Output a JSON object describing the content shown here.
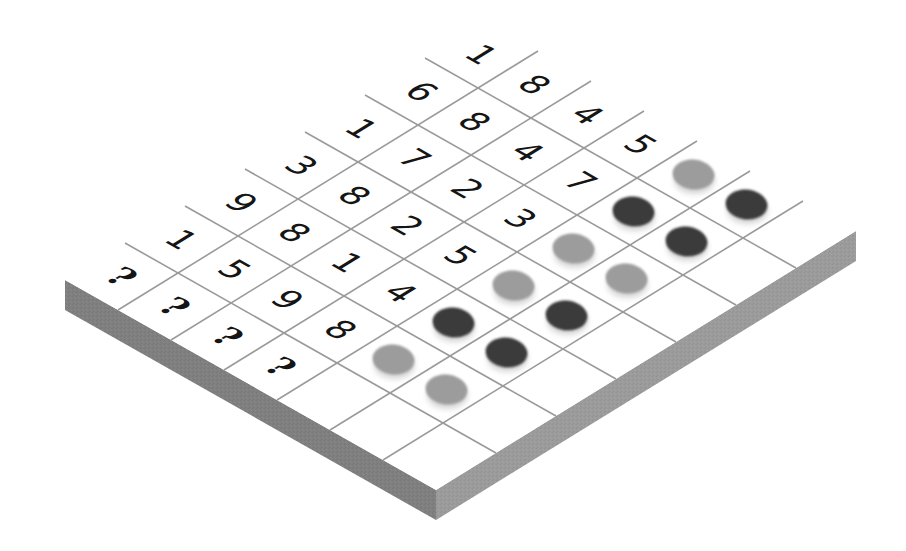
{
  "game": {
    "type": "code-breaking puzzle board",
    "columns": {
      "digit_slots": 4,
      "peg_slots": 2,
      "extra_empty_slots": 1
    },
    "colors": {
      "board_top": "#ffffff",
      "grid_line": "#9a9a9a",
      "side_left": "#7f7f7f",
      "side_right": "#9b9b9b",
      "digit": "#151515",
      "peg_dark": "#3b3b3b",
      "peg_light": "#9c9c9c"
    },
    "rows": [
      {
        "digits": [
          "1",
          "8",
          "4",
          "5"
        ],
        "pegs": [
          "light",
          "dark"
        ]
      },
      {
        "digits": [
          "6",
          "8",
          "4",
          "7"
        ],
        "pegs": [
          "dark",
          "dark"
        ]
      },
      {
        "digits": [
          "1",
          "7",
          "2",
          "3"
        ],
        "pegs": [
          "light",
          "light"
        ]
      },
      {
        "digits": [
          "3",
          "8",
          "2",
          "5"
        ],
        "pegs": [
          "light",
          "dark"
        ]
      },
      {
        "digits": [
          "9",
          "8",
          "1",
          "4"
        ],
        "pegs": [
          "dark",
          "dark"
        ]
      },
      {
        "digits": [
          "1",
          "5",
          "9",
          "8"
        ],
        "pegs": [
          "light",
          "light"
        ]
      },
      {
        "digits": [
          "?",
          "?",
          "?",
          "?"
        ],
        "pegs": [
          "empty",
          "empty"
        ]
      }
    ]
  }
}
